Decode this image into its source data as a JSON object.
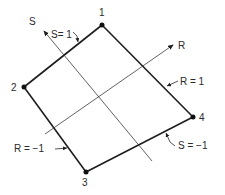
{
  "figure": {
    "nodes": [
      {
        "id": "1",
        "label": "1",
        "x": 102,
        "y": 25
      },
      {
        "id": "2",
        "label": "2",
        "x": 24,
        "y": 87
      },
      {
        "id": "3",
        "label": "3",
        "x": 86,
        "y": 172
      },
      {
        "id": "4",
        "label": "4",
        "x": 193,
        "y": 117
      }
    ],
    "axes": {
      "s": {
        "label": "S"
      },
      "r": {
        "label": "R"
      }
    },
    "edge_labels": {
      "s_pos": "S= 1",
      "r_pos": "R = 1",
      "r_neg": "R = −1",
      "s_neg": "S = −1"
    },
    "colors": {
      "line": "#1e1e1e",
      "text": "#2a2a2a",
      "background": "#ffffff"
    }
  }
}
